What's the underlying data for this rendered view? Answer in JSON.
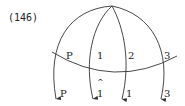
{
  "example": {
    "number": "(146)"
  },
  "diagram": {
    "apex": {
      "x": 112,
      "y": 6
    },
    "colors": {
      "ink": "#333333",
      "text": "#222222",
      "background": "#ffffff"
    },
    "strands": [
      {
        "id": "P",
        "top_label": "P",
        "bottom_label": "P",
        "bottom_hat": ""
      },
      {
        "id": "1",
        "top_label": "1",
        "bottom_label": "1",
        "bottom_hat": "^"
      },
      {
        "id": "2",
        "top_label": "2",
        "bottom_label": "1",
        "bottom_hat": ""
      },
      {
        "id": "3",
        "top_label": "3",
        "bottom_label": "3",
        "bottom_hat": ""
      }
    ],
    "crossing_arc": {
      "description": "horizontal curved line crossing all four strands"
    }
  }
}
